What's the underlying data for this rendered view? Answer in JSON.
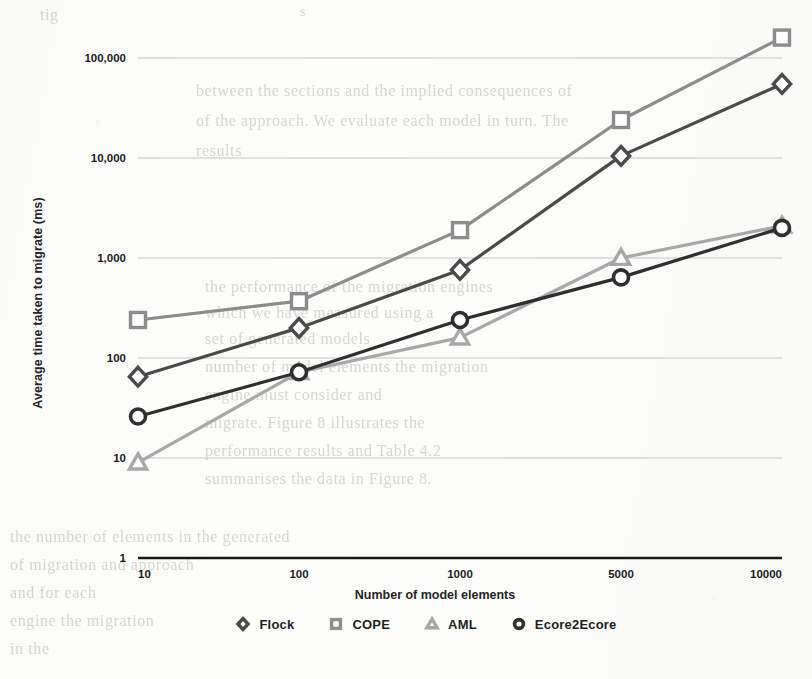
{
  "figure": {
    "y_axis_title": "Average time taken to migrate (ms)",
    "x_axis_title": "Number of model elements"
  },
  "legend": {
    "position": "bottom",
    "items": [
      {
        "label": "Flock",
        "marker": "diamond-marker-icon",
        "color": "#4a4a4a"
      },
      {
        "label": "COPE",
        "marker": "square-marker-icon",
        "color": "#8c8c8c"
      },
      {
        "label": "AML",
        "marker": "triangle-marker-icon",
        "color": "#a8a8a8"
      },
      {
        "label": "Ecore2Ecore",
        "marker": "circle-marker-icon",
        "color": "#2f2f2f"
      }
    ]
  },
  "axes": {
    "y_ticks": [
      "100,000",
      "10,000",
      "1,000",
      "100",
      "10",
      "1"
    ],
    "y_tick_values": [
      100000,
      10000,
      1000,
      100,
      10,
      1
    ],
    "x_ticks": [
      "10",
      "100",
      "1000",
      "5000",
      "10000"
    ]
  },
  "chart_data": {
    "type": "line",
    "title": "",
    "xlabel": "Number of model elements",
    "ylabel": "Average time taken to migrate (ms)",
    "x_scale": "category",
    "y_scale": "log",
    "ylim": [
      1,
      100000
    ],
    "grid": true,
    "legend_position": "bottom",
    "categories": [
      "10",
      "100",
      "1000",
      "5000",
      "10000"
    ],
    "series": [
      {
        "name": "Flock",
        "color": "#4a4a4a",
        "marker": "diamond",
        "values": [
          65,
          200,
          760,
          10500,
          55000
        ]
      },
      {
        "name": "COPE",
        "color": "#8c8c8c",
        "marker": "square",
        "values": [
          240,
          370,
          1900,
          24000,
          160000
        ]
      },
      {
        "name": "AML",
        "color": "#a8a8a8",
        "marker": "triangle",
        "values": [
          9,
          72,
          160,
          1000,
          2100
        ]
      },
      {
        "name": "Ecore2Ecore",
        "color": "#2f2f2f",
        "marker": "circle",
        "values": [
          26,
          72,
          240,
          640,
          2000
        ]
      }
    ]
  },
  "background_ghost_text": [
    {
      "text": "tig",
      "x": 40,
      "y": 6,
      "size": 16
    },
    {
      "text": "s",
      "x": 300,
      "y": 4,
      "size": 14
    },
    {
      "text": "between the sections and the implied consequences of",
      "x": 196,
      "y": 82,
      "size": 16
    },
    {
      "text": "of the approach. We evaluate each model in turn. The",
      "x": 196,
      "y": 112,
      "size": 16
    },
    {
      "text": "results",
      "x": 196,
      "y": 142,
      "size": 16
    },
    {
      "text": "the performance of the migration engines",
      "x": 205,
      "y": 278,
      "size": 16
    },
    {
      "text": "which we have measured using a",
      "x": 205,
      "y": 304,
      "size": 16
    },
    {
      "text": "set of generated models",
      "x": 205,
      "y": 330,
      "size": 16
    },
    {
      "text": "number of model elements the migration",
      "x": 205,
      "y": 358,
      "size": 16
    },
    {
      "text": "engine must consider and",
      "x": 205,
      "y": 386,
      "size": 16
    },
    {
      "text": "migrate. Figure 8 illustrates the",
      "x": 205,
      "y": 414,
      "size": 16
    },
    {
      "text": "performance results and Table 4.2",
      "x": 205,
      "y": 442,
      "size": 16
    },
    {
      "text": "summarises the data in Figure 8.",
      "x": 205,
      "y": 470,
      "size": 16
    },
    {
      "text": "the number of elements in the generated",
      "x": 10,
      "y": 528,
      "size": 16
    },
    {
      "text": "of migration and approach",
      "x": 10,
      "y": 556,
      "size": 16
    },
    {
      "text": "and for each",
      "x": 10,
      "y": 584,
      "size": 16
    },
    {
      "text": "engine the migration",
      "x": 10,
      "y": 612,
      "size": 16
    },
    {
      "text": "in the",
      "x": 10,
      "y": 640,
      "size": 16
    }
  ]
}
